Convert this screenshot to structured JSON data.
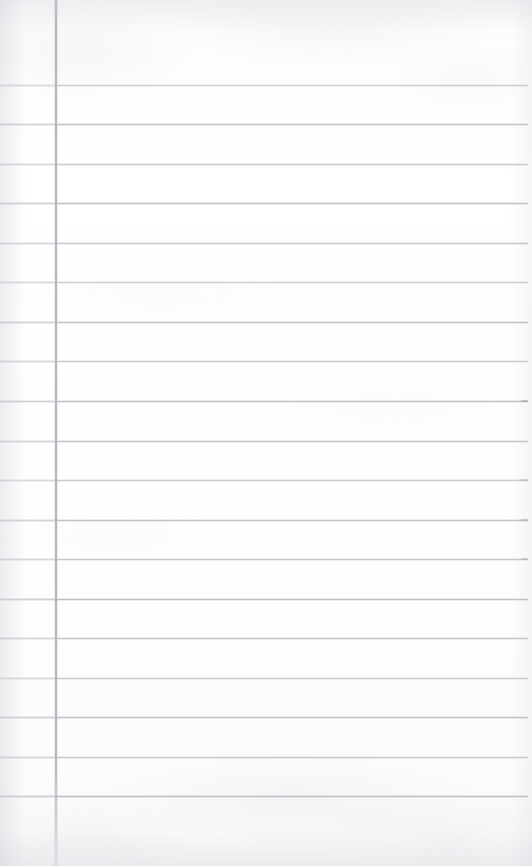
{
  "document": {
    "kind": "scanned-blank-ruled-notepad-page",
    "title": "Blank Lined Notepad Page",
    "visible_text": "",
    "handwriting_present": false,
    "page_width": 532,
    "page_height": 866
  },
  "paper": {
    "background_color": "#fdfdfd",
    "edge_shading_color": "#c4c8ce",
    "texture": "faint scanner mottling, slightly stronger at top and bottom edges"
  },
  "ruling": {
    "style": "college-ruled horizontal rules with single vertical margin rule",
    "horizontal": {
      "count": 19,
      "color": "#b9bcc2",
      "margin_segment_color": "#c9ccd1",
      "thickness_px": 1,
      "first_line_y": 85,
      "spacing_px": 39.5,
      "start_x": 0,
      "end_x": 528,
      "y_positions": [
        85,
        124,
        164,
        203,
        243,
        282,
        322,
        361,
        401,
        441,
        480,
        520,
        559,
        599,
        638,
        678,
        717,
        757,
        796
      ],
      "right_tip_lines": [
        401,
        480,
        520,
        559
      ]
    },
    "vertical_margin": {
      "count": 1,
      "color": "#b2b6bd",
      "thickness_px": 2,
      "x_position": 55,
      "start_y": 0,
      "fade_out_y": 855
    }
  }
}
